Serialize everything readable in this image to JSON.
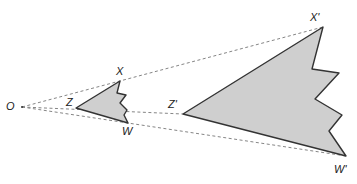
{
  "labels": {
    "O": "O",
    "X": "X",
    "Z": "Z",
    "W": "W",
    "X_prime": "X'",
    "Z_prime": "Z'",
    "W_prime": "W'"
  },
  "colors": {
    "fill": "#cfcfcf",
    "stroke": "#333333",
    "dash": "#777777"
  }
}
